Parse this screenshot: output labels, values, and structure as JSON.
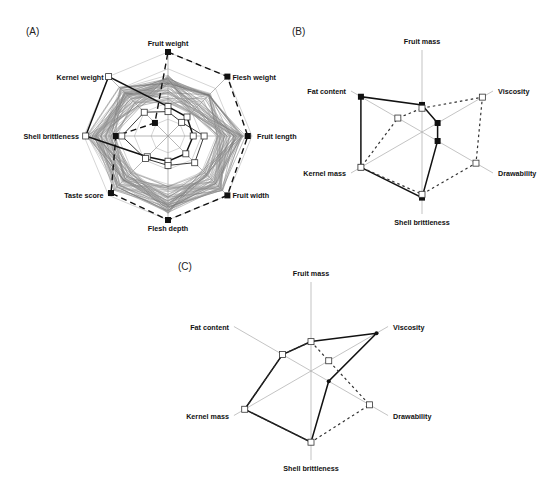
{
  "figure": {
    "caption_fragment": "",
    "panels": [
      "(A)",
      "(B)",
      "(C)"
    ]
  },
  "chart_data": [
    {
      "id": "A",
      "type": "radar",
      "panel_label": "(A)",
      "title": "",
      "center": [
        168,
        136
      ],
      "radius": 84,
      "axes": [
        "Fruit weight",
        "Flesh weight",
        "Fruit length",
        "Fruit width",
        "Flesh depth",
        "Taste score",
        "Shell brittleness",
        "Kernel weight"
      ],
      "axis_angles_deg": [
        -90,
        -45,
        0,
        45,
        90,
        135,
        180,
        225
      ],
      "grid_rings": 5,
      "grid": true,
      "background_series_count": 60,
      "series": [
        {
          "name": "max (dashed)",
          "style": "dashed",
          "marker": "filled-square",
          "values": [
            1.0,
            1.0,
            0.95,
            1.0,
            1.0,
            0.96,
            0.62,
            0.22
          ]
        },
        {
          "name": "highlight (bold)",
          "style": "solid-bold",
          "marker": "open-square",
          "values": [
            0.35,
            0.32,
            0.3,
            0.3,
            0.3,
            0.35,
            0.98,
            1.0
          ]
        },
        {
          "name": "min (open squares)",
          "style": "solid",
          "marker": "open-square",
          "values": [
            0.29,
            0.23,
            0.43,
            0.45,
            0.35,
            0.38,
            0.55,
            0.4
          ]
        }
      ]
    },
    {
      "id": "B",
      "type": "radar",
      "panel_label": "(B)",
      "title": "",
      "center": [
        422,
        132
      ],
      "radius": 82,
      "axes": [
        "Fruit mass",
        "Viscosity",
        "Drawability",
        "Shell brittleness",
        "Kernel mass",
        "Fat content"
      ],
      "axis_angles_deg": [
        -90,
        -30,
        30,
        90,
        150,
        210
      ],
      "grid": false,
      "series": [
        {
          "name": "solid",
          "style": "solid-bold",
          "marker": "filled-square",
          "values": [
            0.33,
            0.22,
            0.22,
            0.8,
            0.86,
            0.86
          ]
        },
        {
          "name": "dotted",
          "style": "dotted",
          "marker": "open-square",
          "values": [
            0.29,
            0.85,
            0.76,
            0.76,
            0.86,
            0.34
          ]
        }
      ]
    },
    {
      "id": "C",
      "type": "radar",
      "panel_label": "(C)",
      "title": "",
      "center": [
        311,
        371
      ],
      "radius": 89,
      "axes": [
        "Fruit mass",
        "Viscosity",
        "Drawability",
        "Shell brittleness",
        "Kernel mass",
        "Fat content"
      ],
      "axis_angles_deg": [
        -90,
        -30,
        30,
        90,
        150,
        210
      ],
      "grid": false,
      "series": [
        {
          "name": "solid",
          "style": "solid-bold",
          "marker": "filled-dot",
          "values": [
            0.33,
            0.85,
            0.23,
            0.8,
            0.86,
            0.37
          ]
        },
        {
          "name": "dotted",
          "style": "dotted",
          "marker": "open-square",
          "values": [
            0.33,
            0.23,
            0.76,
            0.8,
            0.86,
            0.37
          ]
        }
      ]
    }
  ]
}
